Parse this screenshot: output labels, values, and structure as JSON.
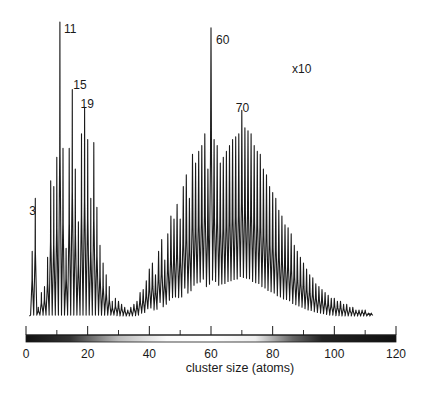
{
  "chart_data": {
    "type": "line",
    "title": "",
    "xlabel": "cluster size (atoms)",
    "ylabel": "",
    "xlim": [
      0,
      120
    ],
    "xticks_major": [
      0,
      20,
      40,
      60,
      80,
      100,
      120
    ],
    "xticks_minor": [
      10,
      30,
      50,
      70,
      90,
      110
    ],
    "grid": false,
    "legend": null,
    "annotations": [
      {
        "text": "3",
        "x": 3
      },
      {
        "text": "11",
        "x": 11
      },
      {
        "text": "15",
        "x": 15
      },
      {
        "text": "19",
        "x": 19
      },
      {
        "text": "60",
        "x": 60
      },
      {
        "text": "70",
        "x": 70
      },
      {
        "text": "x10",
        "x": 87,
        "note": "scale factor applied to region right of ~x=25"
      }
    ],
    "series": [
      {
        "name": "mass spectrum (relative intensity, arbitrary units, peak values)",
        "x": [
          2,
          3,
          4,
          5,
          6,
          7,
          8,
          9,
          10,
          11,
          12,
          13,
          14,
          15,
          16,
          17,
          18,
          19,
          20,
          21,
          22,
          23,
          24,
          25,
          26,
          27,
          28,
          29,
          30,
          31,
          32,
          33,
          34,
          35,
          36,
          37,
          38,
          39,
          40,
          41,
          42,
          43,
          44,
          45,
          46,
          47,
          48,
          49,
          50,
          51,
          52,
          53,
          54,
          55,
          56,
          57,
          58,
          59,
          60,
          61,
          62,
          63,
          64,
          65,
          66,
          67,
          68,
          69,
          70,
          71,
          72,
          73,
          74,
          75,
          76,
          77,
          78,
          79,
          80,
          81,
          82,
          83,
          84,
          85,
          86,
          87,
          88,
          89,
          90,
          91,
          92,
          93,
          94,
          95,
          96,
          97,
          98,
          99,
          100,
          101,
          102,
          103,
          104,
          105,
          106,
          107,
          108,
          109,
          110,
          111,
          112
        ],
        "y": [
          22,
          40,
          3,
          8,
          10,
          20,
          46,
          44,
          54,
          100,
          57,
          23,
          57,
          77,
          50,
          32,
          62,
          71,
          60,
          40,
          59,
          37,
          24,
          18,
          14,
          10,
          5,
          6,
          5,
          4,
          3,
          2,
          3,
          4,
          5,
          8,
          9,
          12,
          16,
          18,
          14,
          22,
          26,
          19,
          28,
          34,
          33,
          38,
          33,
          44,
          48,
          40,
          55,
          52,
          56,
          58,
          62,
          50,
          98,
          60,
          58,
          52,
          54,
          56,
          58,
          60,
          61,
          62,
          70,
          64,
          63,
          62,
          58,
          56,
          55,
          50,
          48,
          44,
          42,
          40,
          36,
          34,
          31,
          30,
          28,
          24,
          22,
          20,
          18,
          16,
          14,
          13,
          11,
          10,
          9,
          8,
          7,
          6,
          6,
          5,
          5,
          4,
          4,
          3,
          3,
          2,
          2,
          2,
          2,
          1,
          1
        ]
      }
    ]
  },
  "figure": {
    "x_axis_label": "cluster size (atoms)",
    "scale_annotation": "x10",
    "tick_labels": [
      "0",
      "20",
      "40",
      "60",
      "80",
      "100",
      "120"
    ],
    "peak_labels": [
      "3",
      "11",
      "15",
      "19",
      "60",
      "70"
    ]
  }
}
